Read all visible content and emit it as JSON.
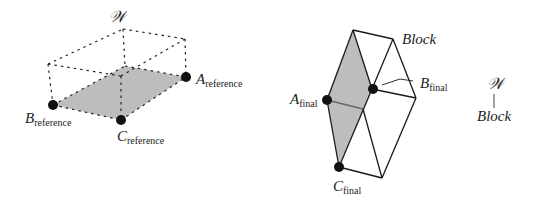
{
  "left_figure": {
    "frame_label": "𝒲",
    "points": {
      "A": {
        "main": "A",
        "sub": "reference"
      },
      "B": {
        "main": "B",
        "sub": "reference"
      },
      "C": {
        "main": "C",
        "sub": "reference"
      }
    }
  },
  "right_figure": {
    "block_label": "Block",
    "points": {
      "A": {
        "main": "A",
        "sub": "final"
      },
      "B": {
        "main": "B",
        "sub": "final"
      },
      "C": {
        "main": "C",
        "sub": "final"
      }
    }
  },
  "tree": {
    "parent": "𝒲",
    "child": "Block"
  },
  "colors": {
    "fill": "#bdbdbd",
    "stroke": "#1a1a1a",
    "point": "#111111"
  }
}
